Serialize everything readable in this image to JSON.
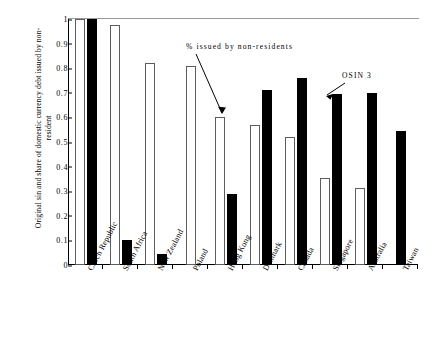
{
  "chart_data": {
    "type": "bar",
    "title": "",
    "xlabel": "",
    "ylabel": "Original sin and share of domestic currency debt issued by non-resident",
    "ylim": [
      0,
      1
    ],
    "ytick_labels": [
      "1",
      "0.9",
      "0.8",
      "0.7",
      "0.6",
      "0.5",
      "0.4",
      "0.3",
      "0.2",
      "0.1",
      "0"
    ],
    "ytick_values": [
      1,
      0.9,
      0.8,
      0.7,
      0.6,
      0.5,
      0.4,
      0.3,
      0.2,
      0.1,
      0
    ],
    "grid": false,
    "legend_position": "none",
    "categories": [
      "Czech Republic",
      "South Africa",
      "New Zealand",
      "Poland",
      "Hong Kong",
      "Denmark",
      "Canada",
      "Singapore",
      "Australia",
      "Taiwan"
    ],
    "series": [
      {
        "name": "% issued by non-residents",
        "style": "white",
        "values": [
          1.0,
          0.975,
          0.82,
          0.81,
          0.6,
          0.57,
          0.52,
          0.355,
          0.315,
          0.0
        ]
      },
      {
        "name": "OSIN 3",
        "style": "black",
        "values": [
          1.0,
          0.1,
          0.045,
          0.0,
          0.29,
          0.71,
          0.76,
          0.695,
          0.7,
          0.545
        ]
      }
    ],
    "annotations": [
      {
        "id": "nonres",
        "text": "% issued by non-residents",
        "points_to": "Hong Kong white bar"
      },
      {
        "id": "osin",
        "text": "OSIN 3",
        "points_to": "Singapore black bar"
      }
    ]
  },
  "colors": {
    "white_bar_fill": "#ffffff",
    "white_bar_border": "#5d5d5d",
    "black_bar_fill": "#000000",
    "axis": "#000000",
    "background": "#ffffff"
  }
}
